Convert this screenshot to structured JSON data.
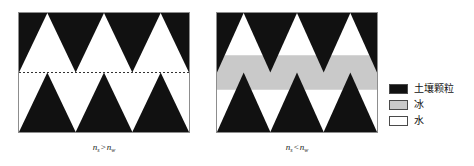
{
  "figure": {
    "title": "",
    "background_color": "#ffffff",
    "width": 474,
    "height": 166
  },
  "panels": [
    {
      "id": "unfrozen",
      "name": "unfrozen-soil-panel",
      "caption_symbol": "n",
      "caption_sub_left": "s",
      "caption_relation": ">",
      "caption_sub_right": "w",
      "caption_text": "n_s > n_w",
      "border_color": "#8d8d8d",
      "background_color": "#ffffff",
      "has_ice_band": false,
      "has_dotted_midline": true,
      "dotted_line_color": "#333333",
      "particle_color": "#111111",
      "water_color": "#ffffff",
      "triangle_rows": 2,
      "triangles_per_row": 3
    },
    {
      "id": "frozen",
      "name": "frozen-soil-panel",
      "caption_symbol": "n",
      "caption_sub_left": "s",
      "caption_relation": "<",
      "caption_sub_right": "w",
      "caption_text": "n_s < n_w",
      "border_color": "#8d8d8d",
      "background_color": "#ffffff",
      "has_ice_band": true,
      "has_dotted_midline": false,
      "ice_band_color": "#c9c9c9",
      "ice_band_top_fraction": 0.355,
      "ice_band_height_fraction": 0.29,
      "particle_color": "#111111",
      "water_color": "#ffffff",
      "triangle_rows": 2,
      "triangles_per_row": 3
    }
  ],
  "legend": {
    "name": "legend",
    "items": [
      {
        "label": "土壤颗粒",
        "swatch_color": "#111111",
        "swatch_border": "#4a4a4a"
      },
      {
        "label": "冰",
        "swatch_color": "#c9c9c9",
        "swatch_border": "#4a4a4a"
      },
      {
        "label": "水",
        "swatch_color": "#ffffff",
        "swatch_border": "#4a4a4a"
      }
    ]
  },
  "colors": {
    "soil_particle": "#111111",
    "ice": "#c9c9c9",
    "water": "#ffffff",
    "panel_border": "#8d8d8d",
    "dotted_line": "#333333"
  }
}
